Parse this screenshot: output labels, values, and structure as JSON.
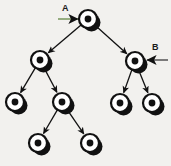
{
  "figure": {
    "type": "binary-tree-diagram",
    "background_color": "#f2f1ee",
    "width": 171,
    "height": 166
  },
  "annotations": {
    "a": {
      "label": "A",
      "target_node": "root",
      "pointer_color": "#7d9b63",
      "pointer_direction": "right",
      "label_x": 62,
      "label_y": 4,
      "arrow_from_x": 58,
      "arrow_from_y": 19,
      "arrow_to_x": 78,
      "arrow_to_y": 19
    },
    "b": {
      "label": "B",
      "target_node": "right-child",
      "pointer_color": "#5c5c5c",
      "pointer_direction": "left",
      "label_x": 152,
      "label_y": 43,
      "arrow_from_x": 168,
      "arrow_from_y": 60,
      "arrow_to_x": 147,
      "arrow_to_y": 60
    }
  },
  "node_style": {
    "fill": "#ffffff",
    "stroke": "#111111",
    "stroke_width": 2.2,
    "center_dot_fill": "#111111",
    "radius": 9,
    "center_dot_radius": 3.4,
    "shadow_fill": "#111111",
    "shadow_offset_x": 3.5,
    "shadow_offset_y": 3.5
  },
  "edge_style": {
    "stroke": "#111111",
    "stroke_width": 1.3,
    "arrowheads": true
  },
  "chart_data": {
    "type": "diagram",
    "title": "",
    "nodes": [
      {
        "id": "root",
        "label": "A",
        "x": 88,
        "y": 19,
        "level": 0
      },
      {
        "id": "n-left",
        "label": "",
        "x": 40,
        "y": 60,
        "level": 1
      },
      {
        "id": "n-right",
        "label": "B",
        "x": 135,
        "y": 61,
        "level": 1
      },
      {
        "id": "n-ll",
        "label": "",
        "x": 15,
        "y": 102,
        "level": 2
      },
      {
        "id": "n-lr",
        "label": "",
        "x": 62,
        "y": 102,
        "level": 2
      },
      {
        "id": "n-rl",
        "label": "",
        "x": 120,
        "y": 103,
        "level": 2
      },
      {
        "id": "n-rr",
        "label": "",
        "x": 152,
        "y": 103,
        "level": 2
      },
      {
        "id": "n-lrl",
        "label": "",
        "x": 38,
        "y": 143,
        "level": 3
      },
      {
        "id": "n-lrr",
        "label": "",
        "x": 90,
        "y": 143,
        "level": 3
      }
    ],
    "edges": [
      {
        "from": "root",
        "to": "n-left"
      },
      {
        "from": "root",
        "to": "n-right"
      },
      {
        "from": "n-left",
        "to": "n-ll"
      },
      {
        "from": "n-left",
        "to": "n-lr"
      },
      {
        "from": "n-right",
        "to": "n-rl"
      },
      {
        "from": "n-right",
        "to": "n-rr"
      },
      {
        "from": "n-lr",
        "to": "n-lrl"
      },
      {
        "from": "n-lr",
        "to": "n-lrr"
      }
    ],
    "node_count": 9,
    "edge_count": 8,
    "depth": 4
  }
}
